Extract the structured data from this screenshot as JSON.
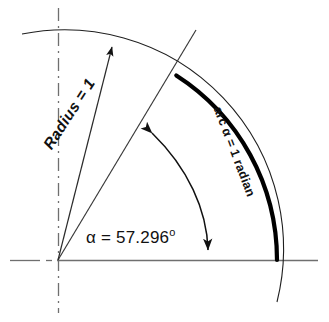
{
  "figure": {
    "background_color": "#ffffff",
    "ink_color": "#111111",
    "axis_color": "#666666"
  },
  "labels": {
    "angle": {
      "name": "angle-label",
      "symbol": "α",
      "equals": " = ",
      "value": "57.296",
      "degree_mark": "o",
      "full_text": "α = 57.296°"
    },
    "radius": {
      "name": "radius-label",
      "text": "Radius = 1",
      "rotation_deg": -57
    },
    "arc": {
      "name": "arc-label",
      "text": "arc α = 1 radian",
      "rotation_deg": 69
    }
  },
  "geometry": {
    "origin": {
      "x": 58,
      "y": 260
    },
    "radius_px": 219,
    "angle_deg": 57.296,
    "unit_arc": {
      "name": "unit-arc-1-radian",
      "stroke_width": 4,
      "start_angle_deg": 57.296,
      "end_angle_deg": 0,
      "color": "#000000"
    },
    "outer_arc": {
      "name": "reference-arc",
      "stroke_width": 1.1,
      "color": "#222222"
    },
    "horizontal_axis": {
      "name": "horizontal-axis",
      "x_start": 10,
      "x_end": 318,
      "y": 260
    },
    "vertical_axis": {
      "name": "vertical-axis",
      "x": 58,
      "y_start": 8,
      "y_end": 313
    },
    "terminal_side": {
      "name": "terminal-side-line",
      "end_x": 196,
      "end_y": 30
    },
    "angle_arrow": {
      "name": "angle-sweep-arrow",
      "double_headed": true
    },
    "radius_leader": {
      "name": "radius-leader-arrow",
      "tip_x": 112,
      "tip_y": 44
    }
  }
}
